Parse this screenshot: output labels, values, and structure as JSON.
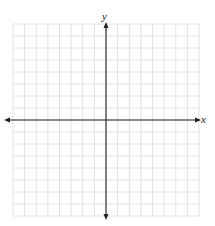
{
  "diagram": {
    "type": "coordinate-plane",
    "axes": {
      "x_label": "x",
      "y_label": "y",
      "axis_color": "#222222",
      "arrowheads": [
        "left",
        "right",
        "top",
        "bottom"
      ]
    },
    "grid": {
      "columns": 16,
      "rows": 16,
      "columns_left_of_origin": 8,
      "columns_right_of_origin": 8,
      "rows_above_origin": 8,
      "rows_below_origin": 8,
      "line_color": "#e2e2e2",
      "background": "#ffffff",
      "bounds": {
        "left": 13,
        "top": 24,
        "right": 199,
        "bottom": 216
      }
    },
    "origin_px": {
      "x": 106,
      "y": 120
    }
  }
}
